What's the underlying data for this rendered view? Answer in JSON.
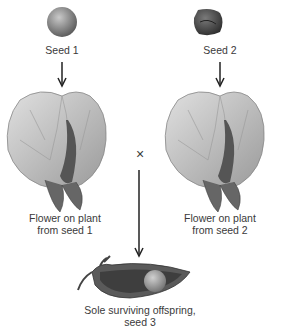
{
  "seeds": [
    {
      "label": "Seed 1",
      "shape": "round"
    },
    {
      "label": "Seed 2",
      "shape": "wrinkled"
    }
  ],
  "flowers": [
    {
      "line1": "Flower on plant",
      "line2": "from seed 1"
    },
    {
      "line1": "Flower on plant",
      "line2": "from seed 2"
    }
  ],
  "cross_symbol": "×",
  "offspring": {
    "line1": "Sole surviving offspring,",
    "line2": "seed 3"
  },
  "colors": {
    "seed_round": "#8a8a8a",
    "seed_wrinkled": "#4a4a4a",
    "petal": "#c8c8c8",
    "pod": "#5a5a5a",
    "arrow": "#222222"
  }
}
